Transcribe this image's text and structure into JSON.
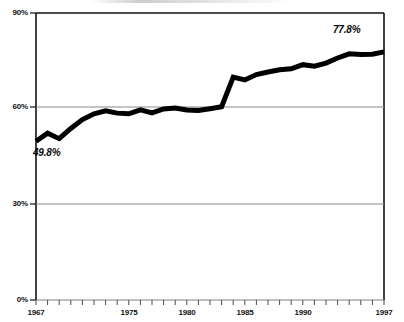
{
  "chart_data": {
    "type": "line",
    "title": "",
    "subtitle": "",
    "xlabel": "",
    "ylabel": "",
    "xlim": [
      1967,
      1997
    ],
    "ylim": [
      0,
      90
    ],
    "grid": "horizontal gridlines at 30% and 60%",
    "legend": "none",
    "y_ticks": [
      "0%",
      "30%",
      "60%",
      "90%"
    ],
    "y_tick_values": [
      0,
      30,
      60,
      90
    ],
    "x_ticks": [
      "1967",
      "1975",
      "1980",
      "1985",
      "1990",
      "1997"
    ],
    "x_tick_values": [
      1967,
      1975,
      1980,
      1985,
      1990,
      1997
    ],
    "x_minor_tick_interval": 1,
    "line_color": "#000000",
    "line_width_px": 5,
    "x": [
      1967,
      1968,
      1969,
      1970,
      1971,
      1972,
      1973,
      1974,
      1975,
      1976,
      1977,
      1978,
      1979,
      1980,
      1981,
      1982,
      1983,
      1984,
      1985,
      1986,
      1987,
      1988,
      1989,
      1990,
      1991,
      1992,
      1993,
      1994,
      1995,
      1996,
      1997
    ],
    "values": [
      49.8,
      52.3,
      50.6,
      53.8,
      56.6,
      58.4,
      59.3,
      58.6,
      58.4,
      59.6,
      58.7,
      59.9,
      60.2,
      59.6,
      59.4,
      60.0,
      60.6,
      69.9,
      69.0,
      70.7,
      71.5,
      72.2,
      72.5,
      73.8,
      73.3,
      74.3,
      75.9,
      77.2,
      77.0,
      77.1,
      77.8
    ],
    "annotations": [
      {
        "label": "49.8%",
        "x": 1967,
        "y": 49.8,
        "position": "below-right"
      },
      {
        "label": "77.8%",
        "x": 1997,
        "y": 77.8,
        "position": "above-left"
      }
    ],
    "series": [
      {
        "name": "series-1",
        "values": [
          49.8,
          52.3,
          50.6,
          53.8,
          56.6,
          58.4,
          59.3,
          58.6,
          58.4,
          59.6,
          58.7,
          59.9,
          60.2,
          59.6,
          59.4,
          60.0,
          60.6,
          69.9,
          69.0,
          70.7,
          71.5,
          72.2,
          72.5,
          73.8,
          73.3,
          74.3,
          75.9,
          77.2,
          77.0,
          77.1,
          77.8
        ]
      }
    ]
  },
  "axes": {
    "y_labels": [
      "90%",
      "60%",
      "30%",
      "0%"
    ],
    "x_labels": [
      "1967",
      "1975",
      "1980",
      "1985",
      "1990",
      "1997"
    ]
  },
  "annotations": {
    "start_value": "49.8%",
    "end_value": "77.8%"
  },
  "colors": {
    "line": "#000000",
    "gridline": "#8a8a8a",
    "axis": "#000000",
    "text": "#111111",
    "background": "#ffffff"
  }
}
